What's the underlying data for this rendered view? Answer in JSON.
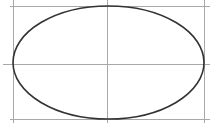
{
  "diagram": {
    "type": "ellipse-with-guides",
    "canvas": {
      "width": 210,
      "height": 123,
      "background": "#ffffff"
    },
    "colors": {
      "ellipse_stroke": "#333333",
      "guide_stroke": "#a8a8a8"
    },
    "ellipse": {
      "cx": 108.5,
      "cy": 62.5,
      "rx": 95.5,
      "ry": 56.5,
      "stroke_width": 1.6
    },
    "guides": {
      "vertical": [
        {
          "name": "left-guide",
          "x": 13,
          "y1": 0,
          "y2": 123
        },
        {
          "name": "center-vertical-guide",
          "x": 107,
          "y1": 0,
          "y2": 123
        },
        {
          "name": "right-guide",
          "x": 204,
          "y1": 0,
          "y2": 123
        }
      ],
      "horizontal": [
        {
          "name": "top-guide",
          "y": 6,
          "x1": 10,
          "x2": 210
        },
        {
          "name": "center-horizontal-guide",
          "y": 64,
          "x1": 3,
          "x2": 210
        },
        {
          "name": "bottom-guide",
          "y": 119,
          "x1": 10,
          "x2": 210
        }
      ]
    }
  }
}
